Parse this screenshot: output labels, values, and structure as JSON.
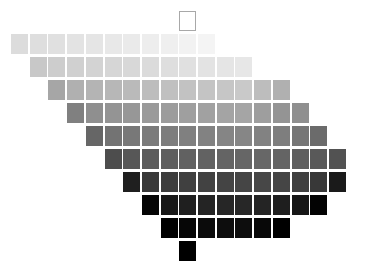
{
  "figure": {
    "title": "",
    "background_color": "#ffffff",
    "width": 370,
    "height": 278
  },
  "chart_data": {
    "type": "heatmap",
    "title": "",
    "subtitle": "",
    "xlabel": "",
    "ylabel": "",
    "grid": false,
    "legend": null,
    "layout": {
      "cell_width": 17,
      "cell_height": 20,
      "cell_pitch_x": 18.7,
      "cell_pitch_y": 23.0,
      "origin_x": 11,
      "origin_y": 34,
      "row_offset_cells": 1,
      "rows": 11,
      "colormap": "grayscale",
      "value_range": [
        0,
        100
      ]
    },
    "rows": [
      {
        "row_index": 0,
        "start_col": 9,
        "y": 11,
        "cells": [
          {
            "col": 9,
            "value": 100,
            "color": "#ffffff",
            "outlined": true
          }
        ]
      },
      {
        "row_index": 1,
        "start_col": 0,
        "y": 34,
        "cells": [
          {
            "col": 0,
            "value": 86,
            "color": "#dcdcdc",
            "outlined": false
          },
          {
            "col": 1,
            "value": 87,
            "color": "#dedede",
            "outlined": false
          },
          {
            "col": 2,
            "value": 88,
            "color": "#e0e0e0",
            "outlined": false
          },
          {
            "col": 3,
            "value": 89,
            "color": "#e3e3e3",
            "outlined": false
          },
          {
            "col": 4,
            "value": 90,
            "color": "#e5e5e5",
            "outlined": false
          },
          {
            "col": 5,
            "value": 91,
            "color": "#e8e8e8",
            "outlined": false
          },
          {
            "col": 6,
            "value": 92,
            "color": "#eaeaea",
            "outlined": false
          },
          {
            "col": 7,
            "value": 93,
            "color": "#ededed",
            "outlined": false
          },
          {
            "col": 8,
            "value": 94,
            "color": "#efefef",
            "outlined": false
          },
          {
            "col": 9,
            "value": 95,
            "color": "#f2f2f2",
            "outlined": false
          },
          {
            "col": 10,
            "value": 96,
            "color": "#f4f4f4",
            "outlined": false
          }
        ]
      },
      {
        "row_index": 2,
        "start_col": 1,
        "y": 57,
        "cells": [
          {
            "col": 1,
            "value": 78,
            "color": "#c8c8c8",
            "outlined": false
          },
          {
            "col": 2,
            "value": 80,
            "color": "#cdcdcd",
            "outlined": false
          },
          {
            "col": 3,
            "value": 81,
            "color": "#d0d0d0",
            "outlined": false
          },
          {
            "col": 4,
            "value": 82,
            "color": "#d3d3d3",
            "outlined": false
          },
          {
            "col": 5,
            "value": 83,
            "color": "#d6d6d6",
            "outlined": false
          },
          {
            "col": 6,
            "value": 84,
            "color": "#d8d8d8",
            "outlined": false
          },
          {
            "col": 7,
            "value": 85,
            "color": "#dbdbdb",
            "outlined": false
          },
          {
            "col": 8,
            "value": 86,
            "color": "#dedede",
            "outlined": false
          },
          {
            "col": 9,
            "value": 87,
            "color": "#e0e0e0",
            "outlined": false
          },
          {
            "col": 10,
            "value": 88,
            "color": "#e3e3e3",
            "outlined": false
          },
          {
            "col": 11,
            "value": 89,
            "color": "#e5e5e5",
            "outlined": false
          },
          {
            "col": 12,
            "value": 90,
            "color": "#e7e7e7",
            "outlined": false
          }
        ]
      },
      {
        "row_index": 3,
        "start_col": 2,
        "y": 80,
        "cells": [
          {
            "col": 2,
            "value": 64,
            "color": "#a6a6a6",
            "outlined": false
          },
          {
            "col": 3,
            "value": 68,
            "color": "#b0b0b0",
            "outlined": false
          },
          {
            "col": 4,
            "value": 70,
            "color": "#b4b4b4",
            "outlined": false
          },
          {
            "col": 5,
            "value": 71,
            "color": "#b7b7b7",
            "outlined": false
          },
          {
            "col": 6,
            "value": 72,
            "color": "#bababa",
            "outlined": false
          },
          {
            "col": 7,
            "value": 73,
            "color": "#bdbdbd",
            "outlined": false
          },
          {
            "col": 8,
            "value": 74,
            "color": "#c0c0c0",
            "outlined": false
          },
          {
            "col": 9,
            "value": 75,
            "color": "#c2c2c2",
            "outlined": false
          },
          {
            "col": 10,
            "value": 76,
            "color": "#c4c4c4",
            "outlined": false
          },
          {
            "col": 11,
            "value": 77,
            "color": "#c6c6c6",
            "outlined": false
          },
          {
            "col": 12,
            "value": 78,
            "color": "#c9c9c9",
            "outlined": false
          },
          {
            "col": 13,
            "value": 73,
            "color": "#bdbdbd",
            "outlined": false
          },
          {
            "col": 14,
            "value": 68,
            "color": "#b0b0b0",
            "outlined": false
          }
        ]
      },
      {
        "row_index": 4,
        "start_col": 3,
        "y": 103,
        "cells": [
          {
            "col": 3,
            "value": 50,
            "color": "#808080",
            "outlined": false
          },
          {
            "col": 4,
            "value": 56,
            "color": "#8f8f8f",
            "outlined": false
          },
          {
            "col": 5,
            "value": 58,
            "color": "#949494",
            "outlined": false
          },
          {
            "col": 6,
            "value": 59,
            "color": "#979797",
            "outlined": false
          },
          {
            "col": 7,
            "value": 60,
            "color": "#9a9a9a",
            "outlined": false
          },
          {
            "col": 8,
            "value": 61,
            "color": "#9c9c9c",
            "outlined": false
          },
          {
            "col": 9,
            "value": 62,
            "color": "#9f9f9f",
            "outlined": false
          },
          {
            "col": 10,
            "value": 63,
            "color": "#a1a1a1",
            "outlined": false
          },
          {
            "col": 11,
            "value": 64,
            "color": "#a4a4a4",
            "outlined": false
          },
          {
            "col": 12,
            "value": 64,
            "color": "#a5a5a5",
            "outlined": false
          },
          {
            "col": 13,
            "value": 62,
            "color": "#9e9e9e",
            "outlined": false
          },
          {
            "col": 14,
            "value": 58,
            "color": "#949494",
            "outlined": false
          },
          {
            "col": 15,
            "value": 56,
            "color": "#8f8f8f",
            "outlined": false
          }
        ]
      },
      {
        "row_index": 5,
        "start_col": 4,
        "y": 126,
        "cells": [
          {
            "col": 4,
            "value": 40,
            "color": "#666666",
            "outlined": false
          },
          {
            "col": 5,
            "value": 45,
            "color": "#737373",
            "outlined": false
          },
          {
            "col": 6,
            "value": 47,
            "color": "#787878",
            "outlined": false
          },
          {
            "col": 7,
            "value": 48,
            "color": "#7b7b7b",
            "outlined": false
          },
          {
            "col": 8,
            "value": 49,
            "color": "#7d7d7d",
            "outlined": false
          },
          {
            "col": 9,
            "value": 50,
            "color": "#808080",
            "outlined": false
          },
          {
            "col": 10,
            "value": 51,
            "color": "#828282",
            "outlined": false
          },
          {
            "col": 11,
            "value": 52,
            "color": "#858585",
            "outlined": false
          },
          {
            "col": 12,
            "value": 52,
            "color": "#868686",
            "outlined": false
          },
          {
            "col": 13,
            "value": 51,
            "color": "#828282",
            "outlined": false
          },
          {
            "col": 14,
            "value": 49,
            "color": "#7e7e7e",
            "outlined": false
          },
          {
            "col": 15,
            "value": 46,
            "color": "#767676",
            "outlined": false
          },
          {
            "col": 16,
            "value": 42,
            "color": "#6b6b6b",
            "outlined": false
          }
        ]
      },
      {
        "row_index": 6,
        "start_col": 5,
        "y": 149,
        "cells": [
          {
            "col": 5,
            "value": 30,
            "color": "#4d4d4d",
            "outlined": false
          },
          {
            "col": 6,
            "value": 34,
            "color": "#575757",
            "outlined": false
          },
          {
            "col": 7,
            "value": 36,
            "color": "#5c5c5c",
            "outlined": false
          },
          {
            "col": 8,
            "value": 37,
            "color": "#5e5e5e",
            "outlined": false
          },
          {
            "col": 9,
            "value": 38,
            "color": "#616161",
            "outlined": false
          },
          {
            "col": 10,
            "value": 38,
            "color": "#626262",
            "outlined": false
          },
          {
            "col": 11,
            "value": 39,
            "color": "#646464",
            "outlined": false
          },
          {
            "col": 12,
            "value": 40,
            "color": "#666666",
            "outlined": false
          },
          {
            "col": 13,
            "value": 40,
            "color": "#676767",
            "outlined": false
          },
          {
            "col": 14,
            "value": 39,
            "color": "#646464",
            "outlined": false
          },
          {
            "col": 15,
            "value": 37,
            "color": "#5f5f5f",
            "outlined": false
          },
          {
            "col": 16,
            "value": 35,
            "color": "#595959",
            "outlined": false
          },
          {
            "col": 17,
            "value": 32,
            "color": "#525252",
            "outlined": false
          }
        ]
      },
      {
        "row_index": 7,
        "start_col": 6,
        "y": 172,
        "cells": [
          {
            "col": 6,
            "value": 12,
            "color": "#1f1f1f",
            "outlined": false
          },
          {
            "col": 7,
            "value": 22,
            "color": "#393939",
            "outlined": false
          },
          {
            "col": 8,
            "value": 24,
            "color": "#3d3d3d",
            "outlined": false
          },
          {
            "col": 9,
            "value": 25,
            "color": "#404040",
            "outlined": false
          },
          {
            "col": 10,
            "value": 26,
            "color": "#424242",
            "outlined": false
          },
          {
            "col": 11,
            "value": 27,
            "color": "#444444",
            "outlined": false
          },
          {
            "col": 12,
            "value": 27,
            "color": "#454545",
            "outlined": false
          },
          {
            "col": 13,
            "value": 28,
            "color": "#474747",
            "outlined": false
          },
          {
            "col": 14,
            "value": 27,
            "color": "#454545",
            "outlined": false
          },
          {
            "col": 15,
            "value": 25,
            "color": "#404040",
            "outlined": false
          },
          {
            "col": 16,
            "value": 22,
            "color": "#383838",
            "outlined": false
          },
          {
            "col": 17,
            "value": 10,
            "color": "#1a1a1a",
            "outlined": false
          }
        ]
      },
      {
        "row_index": 8,
        "start_col": 7,
        "y": 195,
        "cells": [
          {
            "col": 7,
            "value": 2,
            "color": "#050505",
            "outlined": false
          },
          {
            "col": 8,
            "value": 9,
            "color": "#171717",
            "outlined": false
          },
          {
            "col": 9,
            "value": 12,
            "color": "#1f1f1f",
            "outlined": false
          },
          {
            "col": 10,
            "value": 14,
            "color": "#242424",
            "outlined": false
          },
          {
            "col": 11,
            "value": 15,
            "color": "#262626",
            "outlined": false
          },
          {
            "col": 12,
            "value": 15,
            "color": "#272727",
            "outlined": false
          },
          {
            "col": 13,
            "value": 14,
            "color": "#242424",
            "outlined": false
          },
          {
            "col": 14,
            "value": 12,
            "color": "#1e1e1e",
            "outlined": false
          },
          {
            "col": 15,
            "value": 9,
            "color": "#161616",
            "outlined": false
          },
          {
            "col": 16,
            "value": 1,
            "color": "#030303",
            "outlined": false
          }
        ]
      },
      {
        "row_index": 9,
        "start_col": 8,
        "y": 218,
        "cells": [
          {
            "col": 8,
            "value": 0,
            "color": "#000000",
            "outlined": false
          },
          {
            "col": 9,
            "value": 2,
            "color": "#060606",
            "outlined": false
          },
          {
            "col": 10,
            "value": 4,
            "color": "#0b0b0b",
            "outlined": false
          },
          {
            "col": 11,
            "value": 5,
            "color": "#0d0d0d",
            "outlined": false
          },
          {
            "col": 12,
            "value": 5,
            "color": "#0d0d0d",
            "outlined": false
          },
          {
            "col": 13,
            "value": 3,
            "color": "#080808",
            "outlined": false
          },
          {
            "col": 14,
            "value": 0,
            "color": "#000000",
            "outlined": false
          }
        ]
      },
      {
        "row_index": 10,
        "start_col": 9,
        "y": 241,
        "cells": [
          {
            "col": 9,
            "value": 0,
            "color": "#000000",
            "outlined": false
          }
        ]
      }
    ]
  }
}
